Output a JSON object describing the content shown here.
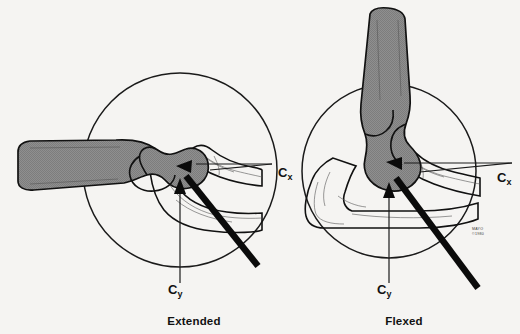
{
  "figure": {
    "title_absent": true,
    "background_color": "#f5f4f2",
    "ink_color": "#111111",
    "bone_shade_color": "#8a8a8a",
    "pin_color": "#0b0b0b"
  },
  "panels": [
    {
      "id": "extended",
      "caption": "Extended",
      "caption_x": 194,
      "caption_y": 325,
      "circle": {
        "cx": 180,
        "cy": 170,
        "r": 97
      },
      "axes": {
        "horizontal": {
          "label": "C",
          "subscript": "x",
          "label_x": 278,
          "label_y": 177,
          "line_y": 164,
          "line_x1": 196,
          "line_x2": 272
        },
        "vertical": {
          "label": "C",
          "subscript": "y",
          "label_x": 168,
          "label_y": 294,
          "line_x": 180,
          "line_y1": 186,
          "line_y2": 283
        }
      }
    },
    {
      "id": "flexed",
      "caption": "Flexed",
      "caption_x": 404,
      "caption_y": 325,
      "circle": {
        "cx": 389,
        "cy": 171,
        "r": 87
      },
      "axes": {
        "horizontal": {
          "label": "C",
          "subscript": "x",
          "label_x": 497,
          "label_y": 182,
          "line_y": 163,
          "line_x1": 404,
          "line_x2": 512
        },
        "vertical": {
          "label": "C",
          "subscript": "y",
          "label_x": 377,
          "label_y": 294,
          "line_x": 389,
          "line_y1": 190,
          "line_y2": 283
        }
      }
    }
  ],
  "copyright": {
    "line1": "MAYO",
    "line2": "©1980",
    "x": 472,
    "y": 230
  }
}
